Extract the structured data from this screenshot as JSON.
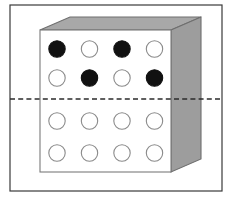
{
  "figure": {
    "canvas": {
      "width": 231,
      "height": 200,
      "background": "#ffffff"
    },
    "frame": {
      "label": "outer-border",
      "x": 10,
      "y": 5,
      "width": 212,
      "height": 186,
      "stroke": "#3a3a3a",
      "stroke_width": 1.2,
      "fill": "none"
    },
    "box": {
      "label": "3d-box",
      "front_face": {
        "label": "front-face",
        "x": 40,
        "y": 30,
        "width": 131,
        "height": 142,
        "fill": "#ffffff",
        "stroke": "#7a7a7a",
        "stroke_width": 1.1
      },
      "top_face": {
        "label": "top-face",
        "points": "40,30 70,17 201,17 171,30",
        "fill": "#a8a8a8",
        "stroke": "#6e6e6e",
        "stroke_width": 1.1
      },
      "side_face": {
        "label": "right-side-face",
        "points": "171,30 201,17 201,159 171,172",
        "fill": "#9d9d9d",
        "stroke": "#6e6e6e",
        "stroke_width": 1.1
      }
    },
    "dashed_line": {
      "label": "horizontal-cut-plane",
      "x1": 10,
      "x2": 222,
      "y": 99,
      "stroke": "#2b2b2b",
      "stroke_width": 1.6,
      "dash_pattern": "5,3.2"
    },
    "grid": {
      "label": "circle-grid",
      "rows": 4,
      "columns": 4,
      "radius": 8.2,
      "filled_color": "#111111",
      "open_fill": "#ffffff",
      "open_stroke": "#8a8a8a",
      "filled_stroke": "#111111",
      "stroke_width": 1.1,
      "column_x": [
        57,
        89.5,
        122,
        154.5
      ],
      "row_y": [
        49,
        78,
        121,
        153
      ],
      "circles": [
        {
          "row": 1,
          "col": 1,
          "cx": 57,
          "cy": 49,
          "state": "filled"
        },
        {
          "row": 1,
          "col": 2,
          "cx": 89.5,
          "cy": 49,
          "state": "open"
        },
        {
          "row": 1,
          "col": 3,
          "cx": 122,
          "cy": 49,
          "state": "filled"
        },
        {
          "row": 1,
          "col": 4,
          "cx": 154.5,
          "cy": 49,
          "state": "open"
        },
        {
          "row": 2,
          "col": 1,
          "cx": 57,
          "cy": 78,
          "state": "open"
        },
        {
          "row": 2,
          "col": 2,
          "cx": 89.5,
          "cy": 78,
          "state": "filled"
        },
        {
          "row": 2,
          "col": 3,
          "cx": 122,
          "cy": 78,
          "state": "open"
        },
        {
          "row": 2,
          "col": 4,
          "cx": 154.5,
          "cy": 78,
          "state": "filled"
        },
        {
          "row": 3,
          "col": 1,
          "cx": 57,
          "cy": 121,
          "state": "open"
        },
        {
          "row": 3,
          "col": 2,
          "cx": 89.5,
          "cy": 121,
          "state": "open"
        },
        {
          "row": 3,
          "col": 3,
          "cx": 122,
          "cy": 121,
          "state": "open"
        },
        {
          "row": 3,
          "col": 4,
          "cx": 154.5,
          "cy": 121,
          "state": "open"
        },
        {
          "row": 4,
          "col": 1,
          "cx": 57,
          "cy": 153,
          "state": "open"
        },
        {
          "row": 4,
          "col": 2,
          "cx": 89.5,
          "cy": 153,
          "state": "open"
        },
        {
          "row": 4,
          "col": 3,
          "cx": 122,
          "cy": 153,
          "state": "open"
        },
        {
          "row": 4,
          "col": 4,
          "cx": 154.5,
          "cy": 153,
          "state": "open"
        }
      ]
    }
  }
}
